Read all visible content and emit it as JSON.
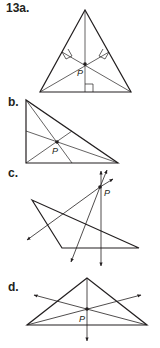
{
  "problem": {
    "number": "13",
    "parts": [
      {
        "label": "13a.",
        "point_label": "P",
        "description": "Triangle with altitudes meeting at P (right angle marks)"
      },
      {
        "label": "b.",
        "point_label": "P",
        "description": "Right triangle with concurrent lines meeting at P"
      },
      {
        "label": "c.",
        "point_label": "P",
        "description": "Obtuse triangle with extended lines (arrows) meeting at P outside"
      },
      {
        "label": "d.",
        "point_label": "P",
        "description": "Triangle with lines (arrows) meeting at P"
      }
    ]
  },
  "colors": {
    "stroke": "#231f20",
    "background": "#ffffff"
  }
}
